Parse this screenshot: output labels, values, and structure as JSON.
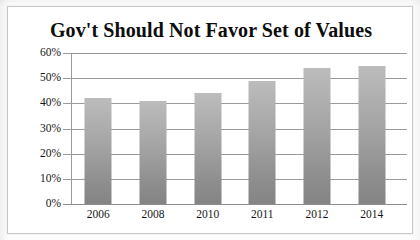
{
  "chart_data": {
    "type": "bar",
    "title": "Gov't Should Not Favor Set of Values",
    "categories": [
      "2006",
      "2008",
      "2010",
      "2011",
      "2012",
      "2014"
    ],
    "values": [
      42,
      41,
      44,
      49,
      54,
      55
    ],
    "xlabel": "",
    "ylabel": "",
    "ylim": [
      0,
      60
    ],
    "ytick_values": [
      60,
      50,
      40,
      30,
      20,
      10,
      0
    ],
    "ytick_labels": [
      "60%",
      "50%",
      "40%",
      "30%",
      "20%",
      "10%",
      "0%"
    ],
    "value_suffix": "%",
    "grid": true,
    "grid_axis": "y",
    "legend": false,
    "legend_position": "none",
    "series": [
      {
        "name": "Gov't Should Not Favor Set of Values",
        "values": [
          42,
          41,
          44,
          49,
          54,
          55
        ]
      }
    ],
    "colors": {
      "bar_top": "#bcbcbc",
      "bar_bottom": "#848484",
      "gridline": "#9a9a9a",
      "axis": "#8d8d8d",
      "text": "#161616",
      "title_text": "#0d0d0d",
      "plot_background": "#ffffff",
      "frame_border": "#c9c9c9"
    }
  }
}
